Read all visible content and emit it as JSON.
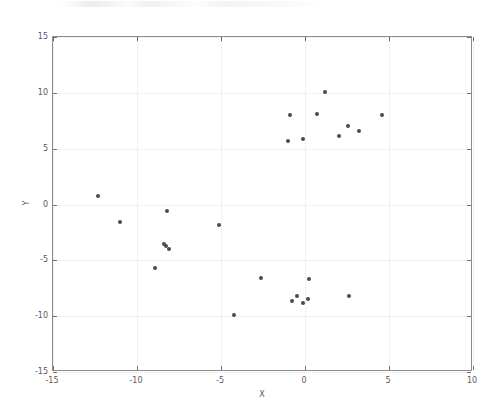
{
  "figure": {
    "background_color": "#ffffff",
    "frame_color": "#3a3a3a",
    "axes_border_color": "#8c8c8c",
    "grid_color": "#e2e2e6",
    "marker_color": "#4a4a52",
    "tick_text_color": "#5a5a5a"
  },
  "chart_data": {
    "type": "scatter",
    "title": "",
    "xlabel": "X",
    "ylabel": "Y",
    "xlim": [
      -15,
      10
    ],
    "ylim": [
      -15,
      15
    ],
    "xticks": [
      -15,
      -10,
      -5,
      0,
      5,
      10
    ],
    "xticklabels": [
      "-15",
      "-10",
      "-5",
      "0",
      "5",
      "10"
    ],
    "yticks": [
      -15,
      -10,
      -5,
      0,
      5,
      10,
      15
    ],
    "yticklabels": [
      "-15",
      "-10",
      "-5",
      "0",
      "5",
      "10",
      "15"
    ],
    "grid": true,
    "grid_style": "dotted",
    "legend": null,
    "marker": "o",
    "marker_size": 4,
    "series": [
      {
        "name": "points",
        "points": [
          [
            -12.3,
            0.75
          ],
          [
            -11.0,
            -1.6
          ],
          [
            -8.9,
            -5.7
          ],
          [
            -8.4,
            -3.5
          ],
          [
            -8.3,
            -3.7
          ],
          [
            -8.1,
            -4.0
          ],
          [
            -8.2,
            -0.55
          ],
          [
            -5.1,
            -1.8
          ],
          [
            -4.2,
            -9.9
          ],
          [
            -2.6,
            -6.6
          ],
          [
            -1.0,
            5.7
          ],
          [
            -0.9,
            8.05
          ],
          [
            -0.8,
            -8.6
          ],
          [
            -0.5,
            -8.2
          ],
          [
            -0.1,
            5.9
          ],
          [
            -0.1,
            -8.8
          ],
          [
            0.2,
            -8.5
          ],
          [
            0.25,
            -6.65
          ],
          [
            0.7,
            8.1
          ],
          [
            1.2,
            10.05
          ],
          [
            2.0,
            6.1
          ],
          [
            2.55,
            7.0
          ],
          [
            2.6,
            -8.15
          ],
          [
            3.2,
            6.6
          ],
          [
            4.6,
            8.0
          ]
        ]
      }
    ]
  }
}
